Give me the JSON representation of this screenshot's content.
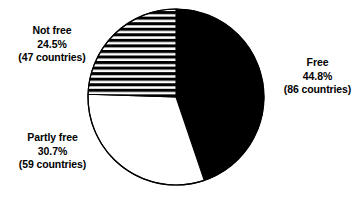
{
  "chart_data": {
    "type": "pie",
    "title": "",
    "subtitle": "",
    "xlabel": "",
    "ylabel": "",
    "grid": false,
    "legend_position": "none",
    "labels_position": "outside",
    "start_angle_deg": 0,
    "direction": "clockwise",
    "total_countries": 192,
    "categories": [
      "Free",
      "Partly free",
      "Not free"
    ],
    "values": [
      44.8,
      30.7,
      24.5
    ],
    "counts": [
      86,
      59,
      47
    ],
    "value_unit": "percent",
    "slices": [
      {
        "name": "Free",
        "percent": 44.8,
        "count": 86,
        "percent_text": "44.8%",
        "count_text": "(86 countries)",
        "fill": "solid-black",
        "color": "#000000",
        "start_deg": 0,
        "end_deg": 161.28
      },
      {
        "name": "Partly free",
        "percent": 30.7,
        "count": 59,
        "percent_text": "30.7%",
        "count_text": "(59 countries)",
        "fill": "white",
        "color": "#ffffff",
        "start_deg": 161.28,
        "end_deg": 271.8
      },
      {
        "name": "Not free",
        "percent": 24.5,
        "count": 47,
        "percent_text": "24.5%",
        "count_text": "(47 countries)",
        "fill": "horizontal-stripes",
        "color": "#000000",
        "start_deg": 271.8,
        "end_deg": 360
      }
    ],
    "geometry": {
      "center_x": 176,
      "center_y": 97,
      "radius": 88,
      "outline_color": "#000000",
      "outline_width": 1.2,
      "background": "#ffffff"
    }
  },
  "labels": {
    "not_free": {
      "name": "Not free",
      "percent": "24.5%",
      "count": "(47 countries)"
    },
    "free": {
      "name": "Free",
      "percent": "44.8%",
      "count": "(86 countries)"
    },
    "partly_free": {
      "name": "Partly free",
      "percent": "30.7%",
      "count": "(59 countries)"
    }
  }
}
